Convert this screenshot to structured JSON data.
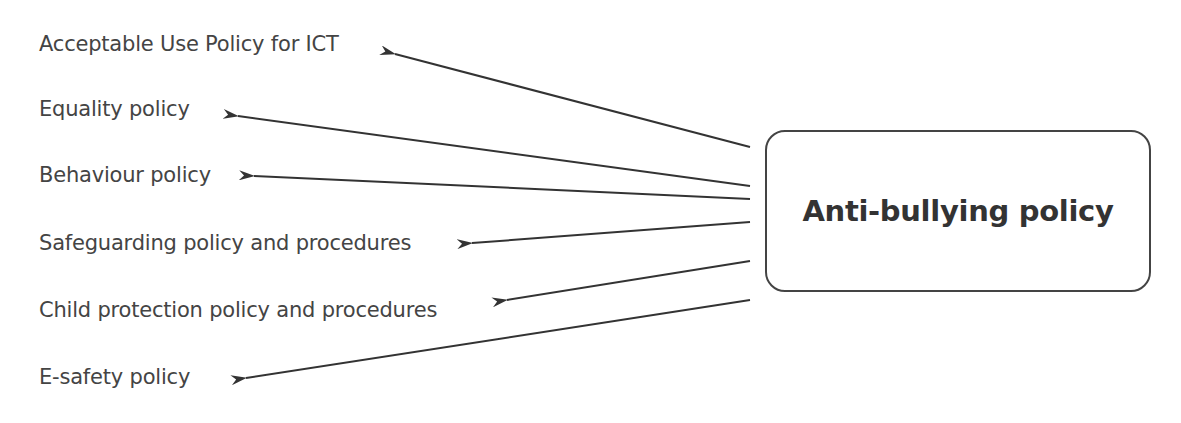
{
  "diagram": {
    "central_node": {
      "label": "Anti-bullying policy"
    },
    "related_policies": [
      {
        "label": "Acceptable Use Policy for ICT"
      },
      {
        "label": "Equality policy"
      },
      {
        "label": "Behaviour policy"
      },
      {
        "label": "Safeguarding policy and procedures"
      },
      {
        "label": "Child protection policy and procedures"
      },
      {
        "label": "E-safety policy"
      }
    ],
    "colors": {
      "text": "#444444",
      "line": "#333333",
      "background": "#ffffff"
    }
  }
}
